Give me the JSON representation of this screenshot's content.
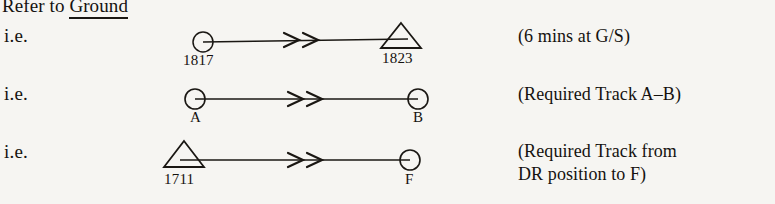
{
  "heading": {
    "prefix": "Refer to ",
    "underlined_word": "Ground"
  },
  "colors": {
    "page_background": "#f6f5f2",
    "ink": "#15120f",
    "line": "#1a1713"
  },
  "rows": [
    {
      "ie_label": "i.e.",
      "start_symbol": "circle",
      "start_label": "1817",
      "end_symbol": "triangle",
      "end_label": "1823",
      "arrowheads": 2,
      "note": "(6 mins at G/S)"
    },
    {
      "ie_label": "i.e.",
      "start_symbol": "circle",
      "start_label": "A",
      "end_symbol": "circle",
      "end_label": "B",
      "arrowheads": 2,
      "note": "(Required Track A–B)"
    },
    {
      "ie_label": "i.e.",
      "start_symbol": "triangle",
      "start_label": "1711",
      "end_symbol": "circle",
      "end_label": "F",
      "arrowheads": 2,
      "note": "(Required Track from\nDR position to F)"
    }
  ]
}
